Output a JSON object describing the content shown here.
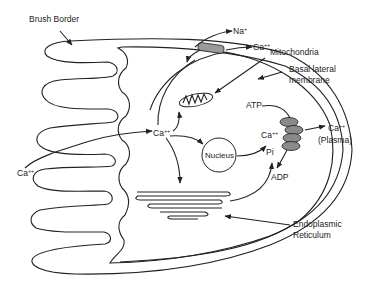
{
  "diagram": {
    "title": "",
    "labels": {
      "brush_border": "Brush Border",
      "na": "Na",
      "na_sup": "+",
      "ca_top": "Ca",
      "ca_top_sup": "++",
      "mitochondria": "Mitochondria",
      "basal_lateral_1": "Basal lateral",
      "basal_lateral_2": "membrane",
      "atp": "ATP",
      "ca_center": "Ca",
      "ca_center_sup": "++",
      "nucleus": "Nucleus",
      "ca_right": "Ca",
      "ca_right_sup": "++",
      "pi": "Pi",
      "adp": "ADP",
      "ca_plasma": "Ca",
      "ca_plasma_sup": "++",
      "plasma": "(Plasma)",
      "ca_left": "Ca",
      "ca_left_sup": "++",
      "er_1": "Endoplasmic",
      "er_2": "Reticulum"
    },
    "colors": {
      "stroke": "#222222",
      "channel_fill": "#9a9a9a",
      "pump_fill": "#8a8a8a",
      "background": "#ffffff"
    }
  }
}
